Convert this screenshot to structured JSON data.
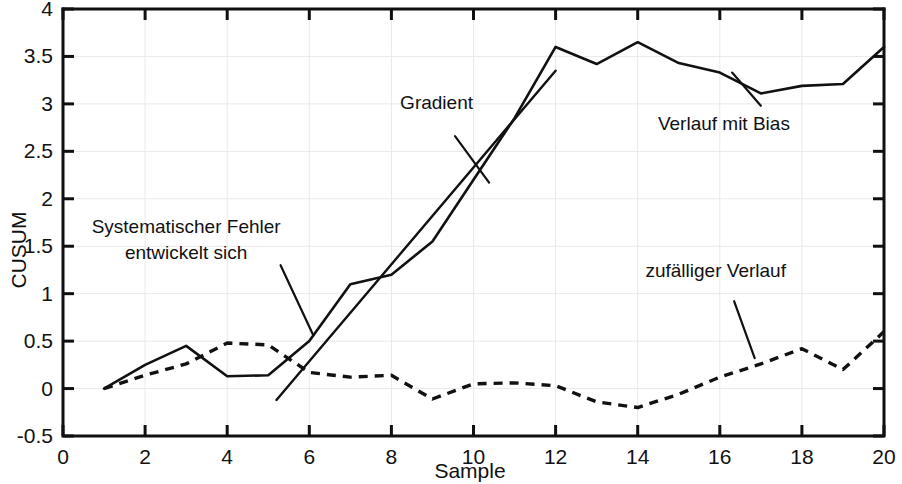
{
  "chart_data": {
    "type": "line",
    "title": "",
    "xlabel": "Sample",
    "ylabel": "CUSUM",
    "xlim": [
      0,
      20
    ],
    "ylim": [
      -0.5,
      4
    ],
    "grid": true,
    "legend_position": "none",
    "xticks": [
      0,
      2,
      4,
      6,
      8,
      10,
      12,
      14,
      16,
      18,
      20
    ],
    "xtick_labels": [
      "0",
      "2",
      "4",
      "6",
      "8",
      "10",
      "12",
      "14",
      "16",
      "18",
      "20"
    ],
    "yticks": [
      -0.5,
      0,
      0.5,
      1,
      1.5,
      2,
      2.5,
      3,
      3.5,
      4
    ],
    "ytick_labels": [
      "-0.5",
      "0",
      "0.5",
      "1",
      "1.5",
      "2",
      "2.5",
      "3",
      "3.5",
      "4"
    ],
    "x": [
      1,
      2,
      3,
      4,
      5,
      6,
      7,
      8,
      9,
      10,
      11,
      12,
      13,
      14,
      15,
      16,
      17,
      18,
      19,
      20
    ],
    "series": [
      {
        "name": "Verlauf mit Bias",
        "style": "solid",
        "values": [
          0.0,
          0.25,
          0.45,
          0.13,
          0.14,
          0.5,
          1.1,
          1.2,
          1.55,
          2.2,
          2.85,
          3.6,
          3.42,
          3.65,
          3.43,
          3.33,
          3.11,
          3.19,
          3.21,
          3.6
        ]
      },
      {
        "name": "zufälliger Verlauf",
        "style": "dashed",
        "values": [
          0.0,
          0.14,
          0.26,
          0.48,
          0.46,
          0.17,
          0.12,
          0.14,
          -0.11,
          0.05,
          0.06,
          0.03,
          -0.14,
          -0.2,
          -0.06,
          0.12,
          0.26,
          0.42,
          0.2,
          0.6
        ]
      }
    ],
    "trend_line": {
      "name": "Gradient",
      "x": [
        5.2,
        12.0
      ],
      "y": [
        -0.12,
        3.35
      ]
    },
    "annotations": [
      {
        "id": "gradient",
        "text": "Gradient",
        "label_x": 9.1,
        "label_y": 2.95,
        "leader": {
          "x1": 9.55,
          "y1": 2.66,
          "x2": 10.38,
          "y2": 2.17
        }
      },
      {
        "id": "systematischer-fehler",
        "text_line1": "Systematischer Fehler",
        "text_line2": "entwickelt sich",
        "label_x": 3.0,
        "label_y": 1.64,
        "leader": {
          "x1": 5.3,
          "y1": 1.3,
          "x2": 6.1,
          "y2": 0.56
        }
      },
      {
        "id": "verlauf-mit-bias",
        "text": "Verlauf mit Bias",
        "label_x": 16.1,
        "label_y": 2.72,
        "leader": {
          "x1": 17.0,
          "y1": 2.98,
          "x2": 16.3,
          "y2": 3.33
        }
      },
      {
        "id": "zufaelliger-verlauf",
        "text": "zufälliger Verlauf",
        "label_x": 15.9,
        "label_y": 1.18,
        "leader": {
          "x1": 16.35,
          "y1": 0.92,
          "x2": 16.85,
          "y2": 0.32
        }
      }
    ]
  }
}
